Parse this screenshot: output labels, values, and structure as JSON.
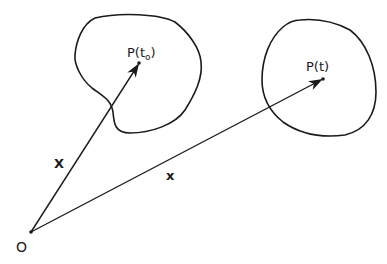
{
  "diagram": {
    "colors": {
      "stroke": "#1a1a1a",
      "background": "#ffffff"
    },
    "origin": {
      "label": "O",
      "x": 31,
      "y": 232
    },
    "regions": [
      {
        "id": "initial-configuration",
        "point_label": "P(t",
        "point_subscript": "o",
        "point_label_close": ")",
        "x": 139,
        "y": 63
      },
      {
        "id": "current-configuration",
        "point_label": "P(t)",
        "x": 323,
        "y": 79
      }
    ],
    "vectors": [
      {
        "label": "X",
        "from": "O",
        "to": "P(to)",
        "weight": "bold"
      },
      {
        "label": "x",
        "from": "O",
        "to": "P(t)",
        "weight": "bold"
      }
    ]
  }
}
